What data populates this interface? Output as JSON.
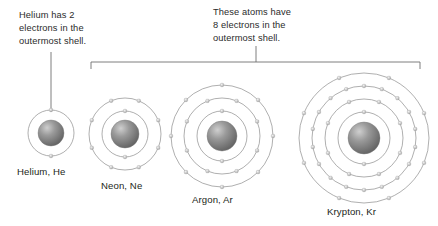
{
  "figure": {
    "background_color": "#ffffff",
    "line_color": "#8c8c8c",
    "nucleus_color": "#6e6e6e",
    "electron_color": "#bdbdbd",
    "text_color": "#231f20"
  },
  "callouts": {
    "helium": {
      "text": "Helium has 2\nelectrons in the\noutermost shell.",
      "leader": "vertical-line"
    },
    "octet": {
      "text": "These atoms have\n8 electrons in the\noutermost shell.",
      "leader": "bracket-with-stem",
      "spans": [
        "Neon, Ne",
        "Argon, Ar",
        "Krypton, Kr"
      ]
    }
  },
  "atoms": [
    {
      "name": "helium",
      "label": "Helium, He",
      "symbol": "He",
      "element": "Helium",
      "shells": [
        2
      ],
      "outermost_electrons": 2,
      "cx": 51,
      "cy": 133,
      "nucleus_r": 13,
      "shell_radii": [
        23
      ]
    },
    {
      "name": "neon",
      "label": "Neon, Ne",
      "symbol": "Ne",
      "element": "Neon",
      "shells": [
        2,
        8
      ],
      "outermost_electrons": 8,
      "cx": 125,
      "cy": 134,
      "nucleus_r": 14,
      "shell_radii": [
        23,
        36
      ]
    },
    {
      "name": "argon",
      "label": "Argon, Ar",
      "symbol": "Ar",
      "element": "Argon",
      "shells": [
        2,
        8,
        8
      ],
      "outermost_electrons": 8,
      "cx": 222,
      "cy": 136,
      "nucleus_r": 15,
      "shell_radii": [
        25,
        38,
        51
      ]
    },
    {
      "name": "krypton",
      "label": "Krypton, Kr",
      "symbol": "Kr",
      "element": "Krypton",
      "shells": [
        2,
        8,
        18,
        8
      ],
      "outermost_electrons": 8,
      "cx": 364,
      "cy": 138,
      "nucleus_r": 16,
      "shell_radii": [
        26,
        39,
        52,
        65
      ]
    }
  ],
  "bracket": {
    "x1": 91,
    "x2": 420,
    "y": 62,
    "tick_height": 7,
    "stem_x": 256,
    "stem_top": 46
  },
  "helium_leader": {
    "x": 51,
    "y1": 52,
    "y2": 112
  }
}
